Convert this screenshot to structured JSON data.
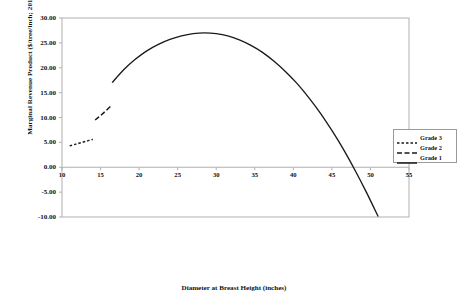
{
  "chart_data": {
    "type": "line",
    "title": "",
    "xlabel": "Diameter at Breast Height (inches)",
    "ylabel": "Marginal Revenue Product ($/tree/inch; 2018 USD)",
    "xlim": [
      10,
      55
    ],
    "ylim": [
      -10.0,
      30.0
    ],
    "xticks": [
      "10",
      "15",
      "20",
      "25",
      "30",
      "35",
      "40",
      "45",
      "50",
      "55"
    ],
    "yticks": [
      "30.00",
      "25.00",
      "20.00",
      "15.00",
      "10.00",
      "5.00",
      "0.00",
      "-5.00",
      "-10.00"
    ],
    "grid": false,
    "legend_position": "right",
    "series": [
      {
        "name": "Grade 3",
        "style": "dotted",
        "color": "#1a1a1a",
        "points": [
          {
            "x": 11.0,
            "y": 4.3
          },
          {
            "x": 11.8,
            "y": 4.65
          },
          {
            "x": 12.6,
            "y": 5.0
          },
          {
            "x": 13.4,
            "y": 5.35
          },
          {
            "x": 14.0,
            "y": 5.6
          }
        ]
      },
      {
        "name": "Grade 2",
        "style": "dashed",
        "color": "#1a1a1a",
        "points": [
          {
            "x": 14.3,
            "y": 9.5
          },
          {
            "x": 15.0,
            "y": 10.4
          },
          {
            "x": 15.7,
            "y": 11.35
          },
          {
            "x": 16.4,
            "y": 12.4
          }
        ]
      },
      {
        "name": "Grade 1",
        "style": "solid",
        "color": "#1a1a1a",
        "points": [
          {
            "x": 16.5,
            "y": 17.0
          },
          {
            "x": 18.0,
            "y": 19.6
          },
          {
            "x": 19.5,
            "y": 21.7
          },
          {
            "x": 21.0,
            "y": 23.4
          },
          {
            "x": 22.5,
            "y": 24.7
          },
          {
            "x": 24.0,
            "y": 25.7
          },
          {
            "x": 25.5,
            "y": 26.4
          },
          {
            "x": 27.0,
            "y": 26.85
          },
          {
            "x": 28.5,
            "y": 27.0
          },
          {
            "x": 30.0,
            "y": 26.85
          },
          {
            "x": 31.5,
            "y": 26.4
          },
          {
            "x": 33.0,
            "y": 25.6
          },
          {
            "x": 34.5,
            "y": 24.5
          },
          {
            "x": 36.0,
            "y": 23.1
          },
          {
            "x": 37.5,
            "y": 21.3
          },
          {
            "x": 39.0,
            "y": 19.2
          },
          {
            "x": 40.5,
            "y": 16.8
          },
          {
            "x": 42.0,
            "y": 14.0
          },
          {
            "x": 43.5,
            "y": 10.9
          },
          {
            "x": 45.0,
            "y": 7.4
          },
          {
            "x": 46.5,
            "y": 3.6
          },
          {
            "x": 48.0,
            "y": -0.6
          },
          {
            "x": 49.5,
            "y": -5.1
          },
          {
            "x": 51.0,
            "y": -9.9
          }
        ]
      }
    ],
    "legend_entries": [
      {
        "label": "Grade 3",
        "style": "dotted"
      },
      {
        "label": "Grade 2",
        "style": "dashed"
      },
      {
        "label": "Grade 1",
        "style": "solid"
      }
    ]
  },
  "axes": {
    "plot_area": {
      "left": 62,
      "top": 18,
      "right": 409,
      "bottom": 217
    },
    "frame_color": "#b0b0b0"
  }
}
